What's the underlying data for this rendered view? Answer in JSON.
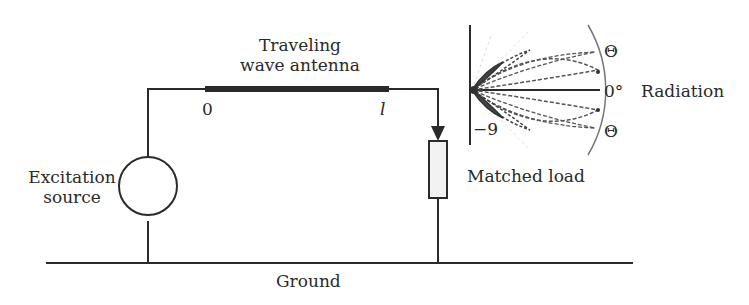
{
  "diagram": {
    "antenna": {
      "label_line1": "Traveling",
      "label_line2": "wave antenna",
      "start_label": "0",
      "end_label": "l"
    },
    "source": {
      "label_line1": "Excitation",
      "label_line2": "source"
    },
    "load": {
      "label": "Matched load"
    },
    "ground": {
      "label": "Ground"
    },
    "radiation": {
      "label": "Radiation",
      "axis_label": "0°",
      "upper_angle_label": "Θ",
      "lower_angle_label": "Θ",
      "side_label": "−9"
    },
    "colors": {
      "line": "#2a2a2a",
      "pattern": "#555555",
      "resistor_fill": "#f2f2f2"
    }
  }
}
